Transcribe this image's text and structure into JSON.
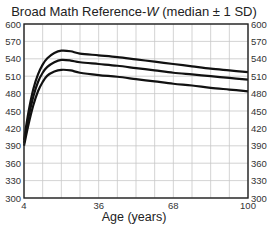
{
  "chart_data": {
    "type": "line",
    "title_prefix": "Broad Math Reference-",
    "title_italic": "W",
    "title_suffix": " (median ± 1 SD)",
    "xlabel": "Age (years)",
    "ylabel": "",
    "xlim": [
      4,
      100
    ],
    "ylim": [
      300,
      600
    ],
    "x_ticks": [
      4,
      36,
      68,
      100
    ],
    "x_grid_step": 8,
    "y_ticks": [
      300,
      330,
      360,
      390,
      420,
      450,
      480,
      510,
      540,
      570,
      600
    ],
    "y_ticks_right": true,
    "grid": true,
    "legend": "none",
    "x": [
      4,
      6,
      8,
      10,
      12,
      14,
      17,
      20,
      24,
      28,
      36,
      44,
      52,
      60,
      68,
      76,
      84,
      92,
      100
    ],
    "series": [
      {
        "name": "median + 1 SD",
        "values": [
          400,
          450,
          488,
          513,
          530,
          541,
          550,
          554,
          553,
          549,
          546,
          543,
          539,
          535,
          531,
          527,
          523,
          520,
          517
        ]
      },
      {
        "name": "median",
        "values": [
          395,
          440,
          475,
          500,
          516,
          526,
          534,
          538,
          537,
          534,
          531,
          528,
          524,
          520,
          516,
          513,
          510,
          507,
          504
        ]
      },
      {
        "name": "median - 1 SD",
        "values": [
          390,
          428,
          460,
          484,
          500,
          511,
          518,
          521,
          520,
          516,
          512,
          509,
          505,
          501,
          497,
          494,
          490,
          487,
          484
        ]
      }
    ]
  }
}
